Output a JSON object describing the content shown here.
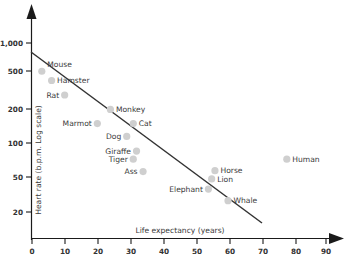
{
  "chart_data": {
    "type": "scatter",
    "title": "",
    "xlabel": "Life expectancy (years)",
    "ylabel": "Heart rate (b.p.m. Log scale)",
    "xlim": [
      0,
      95
    ],
    "ylim": [
      15,
      1400
    ],
    "yscale": "log",
    "grid": false,
    "legend": "none",
    "xticks": [
      0,
      10,
      20,
      30,
      40,
      50,
      60,
      70,
      80,
      90
    ],
    "xticklabels": [
      "0",
      "10",
      "20",
      "30",
      "40",
      "50",
      "60",
      "70",
      "80",
      "90"
    ],
    "yticks": [
      20,
      50,
      100,
      200,
      500,
      1000
    ],
    "yticklabels": [
      "20",
      "50",
      "100",
      "200",
      "500",
      "1,000"
    ],
    "points": [
      {
        "label": "Mouse",
        "x": 3,
        "y": 520,
        "label_pos": "right-up"
      },
      {
        "label": "Hamster",
        "x": 6,
        "y": 420,
        "label_pos": "right"
      },
      {
        "label": "Rat",
        "x": 10,
        "y": 300,
        "label_pos": "left"
      },
      {
        "label": "Monkey",
        "x": 24,
        "y": 215,
        "label_pos": "right"
      },
      {
        "label": "Marmot",
        "x": 20,
        "y": 155,
        "label_pos": "left"
      },
      {
        "label": "Cat",
        "x": 31,
        "y": 155,
        "label_pos": "right"
      },
      {
        "label": "Dog",
        "x": 29,
        "y": 115,
        "label_pos": "left"
      },
      {
        "label": "Giraffe",
        "x": 32,
        "y": 82,
        "label_pos": "left"
      },
      {
        "label": "Tiger",
        "x": 31,
        "y": 68,
        "label_pos": "left"
      },
      {
        "label": "Ass",
        "x": 34,
        "y": 51,
        "label_pos": "left"
      },
      {
        "label": "Human",
        "x": 78,
        "y": 68,
        "label_pos": "right"
      },
      {
        "label": "Horse",
        "x": 56,
        "y": 52,
        "label_pos": "right"
      },
      {
        "label": "Lion",
        "x": 55,
        "y": 43,
        "label_pos": "right"
      },
      {
        "label": "Elephant",
        "x": 54,
        "y": 34,
        "label_pos": "left"
      },
      {
        "label": "Whale",
        "x": 60,
        "y": 26,
        "label_pos": "right"
      }
    ],
    "trendline": {
      "description": "decreasing best-fit line on log scale",
      "x_start": 0,
      "y_start": 730,
      "x_end": 69,
      "y_end": 16
    }
  }
}
